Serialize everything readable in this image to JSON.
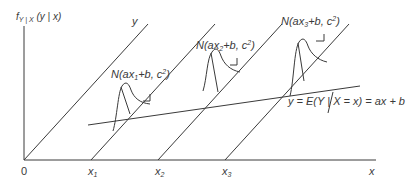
{
  "diagram": {
    "y_axis_label": {
      "f": "f",
      "sub": "Y | X",
      "args": " (y | x)"
    },
    "x_axis_label": "x",
    "origin_label": "0",
    "diagonal_top_label": "y",
    "x_ticks": [
      {
        "base": "x",
        "sub": "1"
      },
      {
        "base": "x",
        "sub": "2"
      },
      {
        "base": "x",
        "sub": "3"
      }
    ],
    "normals": [
      {
        "prefix": "N(ax",
        "sub": "1",
        "mid": "+b, c",
        "sup": "2",
        "suffix": ")"
      },
      {
        "prefix": "N(ax",
        "sub": "2",
        "mid": "+b, c",
        "sup": "2",
        "suffix": ")"
      },
      {
        "prefix": "N(ax",
        "sub": "3",
        "mid": "+b, c",
        "sup": "2",
        "suffix": ")"
      }
    ],
    "regression_label": "y = E(Y | X = x) = ax + b",
    "line_color": "#3a3a3a"
  }
}
